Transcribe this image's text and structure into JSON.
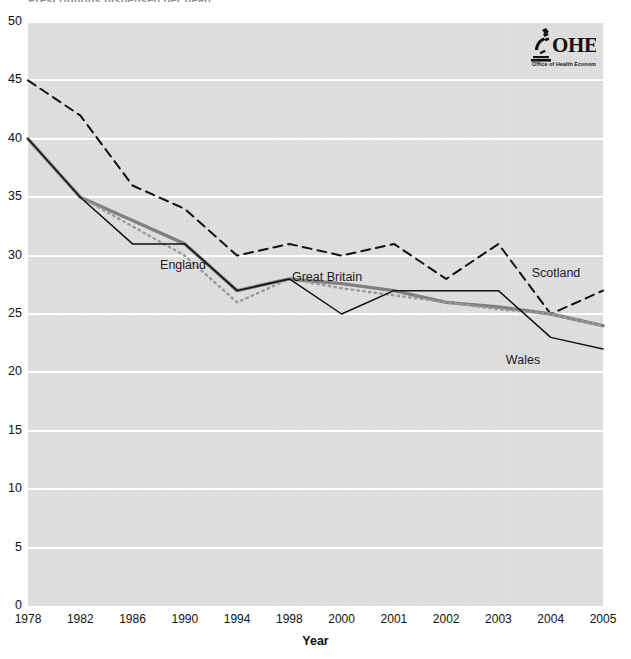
{
  "page": {
    "cut_off_title": "Prescriptions dispensed per head",
    "background": "#ffffff"
  },
  "logo": {
    "name": "ohe-logo",
    "acronym": "OHE",
    "subtitle": "Office of Health Economics",
    "icon": "microscope-icon",
    "color": "#111111"
  },
  "chart_data": {
    "type": "line",
    "title": "",
    "xlabel": "Year",
    "ylabel": "",
    "categories": [
      "1978",
      "1982",
      "1986",
      "1990",
      "1994",
      "1998",
      "2000",
      "2001",
      "2002",
      "2003",
      "2004",
      "2005"
    ],
    "ylim": [
      0,
      50
    ],
    "ytick_step": 5,
    "yticks": [
      "0",
      "5",
      "10",
      "15",
      "20",
      "25",
      "30",
      "35",
      "40",
      "45",
      "50"
    ],
    "grid": "horizontal",
    "legend_position": "inline-annotations",
    "plot_background": "#e1e1e1",
    "gridline_color": "#ffffff",
    "series": [
      {
        "name": "Scotland",
        "style": "dashed",
        "color": "#111111",
        "width": 2.0,
        "label_x": 556,
        "label_y": 273,
        "values": [
          45,
          42,
          36,
          34,
          30,
          31,
          30,
          31,
          28,
          31,
          25,
          27
        ]
      },
      {
        "name": "Great Britain",
        "style": "solid-thick",
        "color": "#808080",
        "width": 3.4,
        "label_x": 327,
        "label_y": 277,
        "values": [
          40,
          35,
          33,
          31,
          27,
          28,
          27.6,
          27,
          26,
          25.6,
          25,
          24
        ]
      },
      {
        "name": "England",
        "style": "dotted",
        "color": "#9a9a9a",
        "width": 2.4,
        "label_x": 183,
        "label_y": 265,
        "values": [
          40,
          35,
          32.5,
          30,
          26,
          28,
          27.2,
          26.6,
          26,
          25.4,
          25,
          24
        ]
      },
      {
        "name": "Wales",
        "style": "solid-thin",
        "color": "#111111",
        "width": 1.5,
        "label_x": 523,
        "label_y": 360,
        "values": [
          40,
          35,
          31,
          31,
          27,
          28,
          25,
          27,
          27,
          27,
          23,
          22
        ]
      }
    ]
  }
}
